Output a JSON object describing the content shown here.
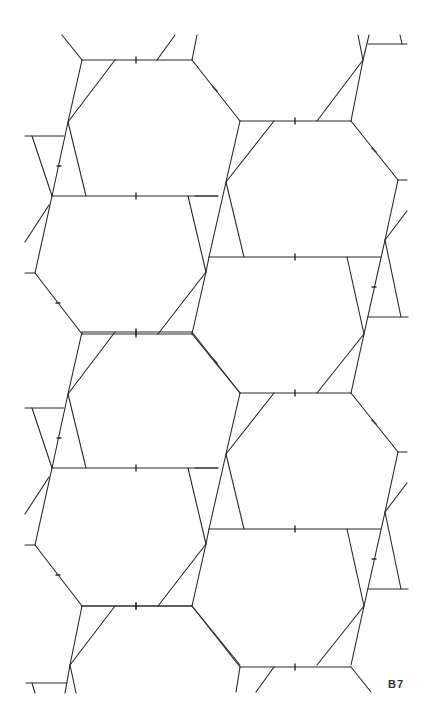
{
  "figure": {
    "label": "B7",
    "stroke_color": "#2a2a2a",
    "background": "#ffffff",
    "period_y": 272
  }
}
